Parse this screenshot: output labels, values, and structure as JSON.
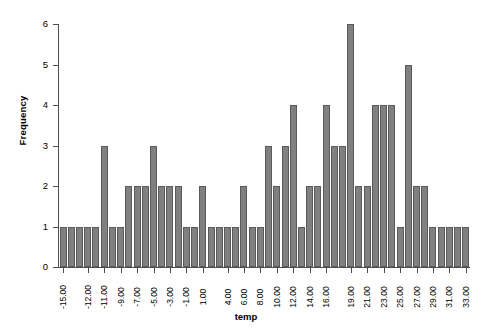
{
  "chart_data": {
    "type": "bar",
    "title": "",
    "xlabel": "temp",
    "ylabel": "Frequency",
    "ylim": [
      0,
      6
    ],
    "yticks": [
      0,
      1,
      2,
      3,
      4,
      5,
      6
    ],
    "grid": false,
    "legend": null,
    "categories": [
      "-15.00",
      "-14.00",
      "-13.00",
      "-12.00",
      "-11.50",
      "-11.00",
      "-10.00",
      "-9.00",
      "-8.00",
      "-7.00",
      "-6.00",
      "-5.00",
      "-4.00",
      "-3.00",
      "-2.00",
      "-1.00",
      "0.00",
      "1.00",
      "2.00",
      "3.00",
      "4.00",
      "5.00",
      "6.00",
      "7.00",
      "8.00",
      "9.00",
      "10.00",
      "11.00",
      "12.00",
      "13.00",
      "14.00",
      "15.00",
      "16.00",
      "17.00",
      "18.00",
      "19.00",
      "20.00",
      "21.00",
      "22.00",
      "23.00",
      "24.00",
      "25.00",
      "26.00",
      "27.00",
      "28.00",
      "29.00",
      "30.00",
      "31.00",
      "32.00",
      "33.00"
    ],
    "values": [
      1,
      1,
      1,
      1,
      1,
      3,
      1,
      1,
      2,
      2,
      2,
      3,
      2,
      2,
      2,
      1,
      1,
      2,
      1,
      1,
      1,
      1,
      2,
      1,
      1,
      3,
      2,
      3,
      4,
      1,
      2,
      2,
      4,
      3,
      3,
      6,
      2,
      2,
      4,
      4,
      4,
      1,
      5,
      2,
      2,
      1,
      1,
      1,
      1,
      1
    ],
    "xtick_labels": [
      "-15.00",
      "-12.00",
      "-11.00",
      "-9.00",
      "-7.00",
      "-5.00",
      "-3.00",
      "-1.00",
      "1.00",
      "4.00",
      "6.00",
      "8.00",
      "10.00",
      "12.00",
      "14.00",
      "16.00",
      "19.00",
      "21.00",
      "23.00",
      "25.00",
      "27.00",
      "29.00",
      "31.00",
      "33.00"
    ],
    "xtick_positions": [
      0,
      3,
      5,
      7,
      9,
      11,
      13,
      15,
      17,
      20,
      22,
      24,
      26,
      28,
      30,
      32,
      35,
      37,
      39,
      41,
      43,
      45,
      47,
      49
    ],
    "bar_color": "#808080",
    "bar_border_color": "#5a5a5a",
    "axis_color": "#4d4d4d",
    "background": "#ffffff"
  }
}
